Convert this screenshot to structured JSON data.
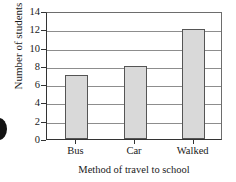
{
  "chart_data": {
    "type": "bar",
    "title": "",
    "categories": [
      "Bus",
      "Car",
      "Walked"
    ],
    "values": [
      7,
      8,
      12
    ],
    "xlabel": "Method of travel to school",
    "ylabel": "Number of students",
    "ylim": [
      0,
      14
    ],
    "ytick_step": 2,
    "yticks": [
      0,
      2,
      4,
      6,
      8,
      10,
      12,
      14
    ],
    "ytick_labels": [
      "0",
      "2",
      "4",
      "6",
      "8",
      "10",
      "12",
      "14"
    ],
    "grid": true,
    "grid_axis": "y",
    "legend": false,
    "bar_fill_color": "#d9d9d9",
    "bar_border_color": "#555555",
    "axis_color": "#333333",
    "gridline_color": "#8d8d8d",
    "background_color": "#ffffff"
  },
  "axes": {
    "y_title": "Number of students",
    "x_title": "Method of travel to school"
  },
  "marker": {
    "name": "edge-bullet"
  }
}
